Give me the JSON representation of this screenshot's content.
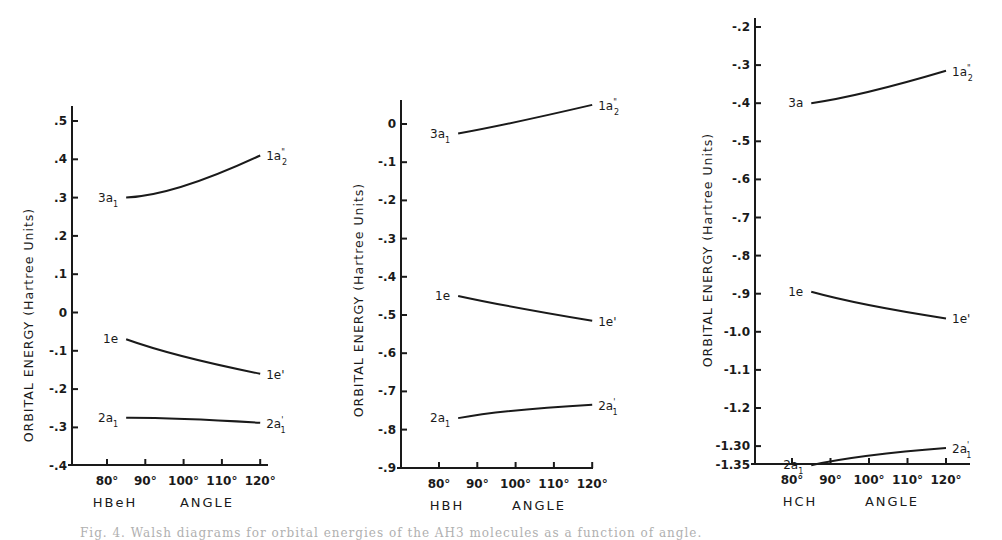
{
  "chart_data": [
    {
      "type": "line",
      "title": "",
      "xlabel": "HBeH ANGLE",
      "ylabel": "ORBITAL ENERGY (Hartree Units)",
      "x_ticks": [
        "80°",
        "90°",
        "100°",
        "110°",
        "120°"
      ],
      "y_ticks": [
        ".5",
        ".4",
        ".3",
        ".2",
        ".1",
        "0",
        "-.1",
        "-.2",
        "-.3",
        "-.4"
      ],
      "ylim": [
        -0.4,
        0.5
      ],
      "xlim": [
        70,
        125
      ],
      "grid": false,
      "series": [
        {
          "name": "3a1 → 1a2\"",
          "left_label": "3a",
          "left_sub": "1",
          "right_label": "1a",
          "right_sub": "2",
          "right_sup": "\"",
          "x": [
            85,
            100,
            120
          ],
          "values": [
            0.3,
            0.33,
            0.41
          ]
        },
        {
          "name": "1e → 1e'",
          "left_label": "1e",
          "left_sub": "",
          "right_label": "1e'",
          "right_sub": "",
          "right_sup": "",
          "x": [
            85,
            100,
            120
          ],
          "values": [
            -0.07,
            -0.115,
            -0.16
          ]
        },
        {
          "name": "2a1 → 2a1'",
          "left_label": "2a",
          "left_sub": "1",
          "right_label": "2a",
          "right_sub": "1",
          "right_sup": "'",
          "x": [
            85,
            100,
            120
          ],
          "values": [
            -0.275,
            -0.278,
            -0.288
          ]
        }
      ]
    },
    {
      "type": "line",
      "title": "",
      "xlabel": "HBH ANGLE",
      "ylabel": "ORBITAL ENERGY (Hartree Units)",
      "x_ticks": [
        "80°",
        "90°",
        "100°",
        "110°",
        "120°"
      ],
      "y_ticks": [
        "0",
        "-.1",
        "-.2",
        "-.3",
        "-.4",
        "-.5",
        "-.6",
        "-.7",
        "-.8",
        "-.9"
      ],
      "ylim": [
        -0.9,
        0.05
      ],
      "xlim": [
        70,
        125
      ],
      "grid": false,
      "series": [
        {
          "name": "3a1 → 1a2\"",
          "left_label": "3a",
          "left_sub": "1",
          "right_label": "1a",
          "right_sub": "2",
          "right_sup": "\"",
          "x": [
            85,
            100,
            120
          ],
          "values": [
            -0.025,
            0.005,
            0.05
          ]
        },
        {
          "name": "1e → 1e'",
          "left_label": "1e",
          "left_sub": "",
          "right_label": "1e'",
          "right_sub": "",
          "right_sup": "",
          "x": [
            85,
            100,
            120
          ],
          "values": [
            -0.45,
            -0.48,
            -0.515
          ]
        },
        {
          "name": "2a1 → 2a1'",
          "left_label": "2a",
          "left_sub": "1",
          "right_label": "2a",
          "right_sub": "1",
          "right_sup": "'",
          "x": [
            85,
            100,
            120
          ],
          "values": [
            -0.77,
            -0.75,
            -0.735
          ]
        }
      ]
    },
    {
      "type": "line",
      "title": "",
      "xlabel": "HCH ANGLE",
      "ylabel": "ORBITAL ENERGY (Hartree Units)",
      "x_ticks": [
        "80°",
        "90°",
        "100°",
        "110°",
        "120°"
      ],
      "y_ticks": [
        "-.2",
        "-.3",
        "-.4",
        "-.5",
        "-.6",
        "-.7",
        "-.8",
        "-.9",
        "-1.0",
        "-1.1",
        "-1.2",
        "-1.30",
        "-1.35"
      ],
      "ylim": [
        -1.35,
        -0.2
      ],
      "xlim": [
        70,
        125
      ],
      "grid": false,
      "series": [
        {
          "name": "3a → 1a2\"",
          "left_label": "3a",
          "left_sub": "",
          "right_label": "1a",
          "right_sub": "2",
          "right_sup": "\"",
          "x": [
            85,
            100,
            120
          ],
          "values": [
            -0.4,
            -0.37,
            -0.315
          ]
        },
        {
          "name": "1e → 1e'",
          "left_label": "1e",
          "left_sub": "",
          "right_label": "1e'",
          "right_sub": "",
          "right_sup": "",
          "x": [
            85,
            100,
            120
          ],
          "values": [
            -0.895,
            -0.93,
            -0.965
          ]
        },
        {
          "name": "2a1 → 2a1'",
          "left_label": "2a",
          "left_sub": "1",
          "right_label": "2a",
          "right_sub": "1",
          "right_sup": "'",
          "x": [
            85,
            100,
            120
          ],
          "values": [
            -1.35,
            -1.325,
            -1.305
          ]
        }
      ]
    }
  ],
  "caption": "Fig. 4. Walsh diagrams for orbital energies of the AH3 molecules as a function of angle."
}
